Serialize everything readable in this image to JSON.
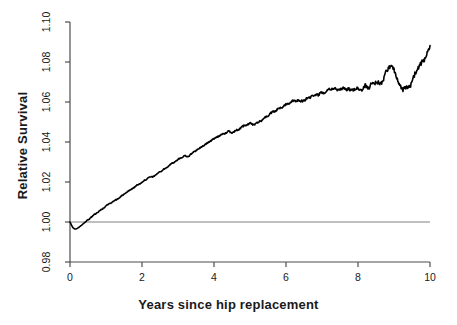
{
  "chart_data": {
    "type": "line",
    "title": "",
    "subtitle": "",
    "xlabel": "Years since hip replacement",
    "ylabel": "Relative Survival",
    "xlim": [
      0,
      10
    ],
    "ylim": [
      0.98,
      1.1
    ],
    "xticks": [
      0,
      2,
      4,
      6,
      8,
      10
    ],
    "xtick_labels": [
      "0",
      "2",
      "4",
      "6",
      "8",
      "10"
    ],
    "yticks": [
      0.98,
      1.0,
      1.02,
      1.04,
      1.06,
      1.08,
      1.1
    ],
    "ytick_labels": [
      "0.98",
      "1.00",
      "1.02",
      "1.04",
      "1.06",
      "1.08",
      "1.10"
    ],
    "grid": false,
    "legend": null,
    "annotations": [],
    "reference_lines": [
      {
        "orientation": "horizontal",
        "y": 1.0,
        "color": "#808080",
        "width": 1
      }
    ],
    "series": [
      {
        "name": "Relative survival",
        "color": "#000000",
        "line_width": 1.6,
        "x": [
          0.0,
          0.04,
          0.08,
          0.12,
          0.16,
          0.2,
          0.26,
          0.32,
          0.4,
          0.5,
          0.6,
          0.7,
          0.8,
          0.9,
          1.0,
          1.1,
          1.2,
          1.3,
          1.4,
          1.5,
          1.6,
          1.7,
          1.8,
          1.9,
          2.0,
          2.1,
          2.2,
          2.3,
          2.4,
          2.5,
          2.6,
          2.7,
          2.8,
          2.9,
          3.0,
          3.1,
          3.2,
          3.25,
          3.3,
          3.4,
          3.5,
          3.6,
          3.7,
          3.8,
          3.9,
          4.0,
          4.1,
          4.2,
          4.3,
          4.4,
          4.5,
          4.6,
          4.7,
          4.8,
          4.9,
          5.0,
          5.1,
          5.2,
          5.3,
          5.4,
          5.5,
          5.6,
          5.7,
          5.8,
          5.9,
          6.0,
          6.1,
          6.2,
          6.3,
          6.4,
          6.5,
          6.6,
          6.7,
          6.8,
          6.9,
          7.0,
          7.1,
          7.2,
          7.3,
          7.4,
          7.5,
          7.6,
          7.7,
          7.8,
          7.9,
          8.0,
          8.1,
          8.2,
          8.3,
          8.4,
          8.5,
          8.6,
          8.7,
          8.8,
          8.9,
          9.0,
          9.1,
          9.2,
          9.3,
          9.4,
          9.5,
          9.6,
          9.7,
          9.8,
          9.9,
          10.0
        ],
        "y": [
          1.0,
          0.9985,
          0.9972,
          0.9966,
          0.9965,
          0.9968,
          0.9975,
          0.9984,
          0.9996,
          1.001,
          1.0025,
          1.004,
          1.0053,
          1.0066,
          1.008,
          1.0092,
          1.0103,
          1.0113,
          1.0126,
          1.0139,
          1.0152,
          1.0163,
          1.0175,
          1.0188,
          1.02,
          1.0212,
          1.0222,
          1.0226,
          1.0238,
          1.0252,
          1.0263,
          1.0274,
          1.0288,
          1.03,
          1.0312,
          1.0324,
          1.0333,
          1.0325,
          1.033,
          1.0344,
          1.0358,
          1.037,
          1.0382,
          1.0392,
          1.0404,
          1.0416,
          1.0428,
          1.0437,
          1.0444,
          1.0452,
          1.0447,
          1.0455,
          1.0466,
          1.0478,
          1.0486,
          1.0492,
          1.0486,
          1.0496,
          1.0508,
          1.052,
          1.0532,
          1.0544,
          1.0556,
          1.0566,
          1.0578,
          1.0588,
          1.0596,
          1.0604,
          1.061,
          1.0604,
          1.0609,
          1.0618,
          1.0626,
          1.0634,
          1.064,
          1.0646,
          1.0655,
          1.0662,
          1.0668,
          1.066,
          1.0663,
          1.0672,
          1.0666,
          1.0654,
          1.0662,
          1.067,
          1.0662,
          1.0682,
          1.067,
          1.069,
          1.07,
          1.0692,
          1.0712,
          1.0758,
          1.0782,
          1.076,
          1.0712,
          1.0668,
          1.0672,
          1.0664,
          1.07,
          1.0742,
          1.0786,
          1.08,
          1.083,
          1.0868
        ]
      }
    ]
  },
  "axes": {
    "x_axis_name": "years-since-hip-replacement-axis",
    "y_axis_name": "relative-survival-axis"
  }
}
